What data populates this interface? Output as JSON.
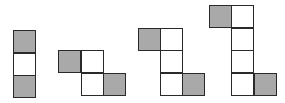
{
  "diagram": {
    "title": "",
    "colors": {
      "shaded": "#a9a9a9",
      "unshaded": "#ffffff",
      "border": "#2a2a2a",
      "background": "#ffffff"
    },
    "cell_size": 23,
    "figures": [
      {
        "index": 1,
        "cells": [
          {
            "x": 13,
            "y": 30,
            "shaded": true
          },
          {
            "x": 13,
            "y": 53,
            "shaded": false
          },
          {
            "x": 13,
            "y": 75,
            "shaded": true
          }
        ]
      },
      {
        "index": 2,
        "cells": [
          {
            "x": 58,
            "y": 50,
            "shaded": true
          },
          {
            "x": 81,
            "y": 50,
            "shaded": false
          },
          {
            "x": 81,
            "y": 73,
            "shaded": false
          },
          {
            "x": 103,
            "y": 73,
            "shaded": true
          }
        ]
      },
      {
        "index": 3,
        "cells": [
          {
            "x": 138,
            "y": 28,
            "shaded": true
          },
          {
            "x": 160,
            "y": 28,
            "shaded": false
          },
          {
            "x": 160,
            "y": 50,
            "shaded": false
          },
          {
            "x": 160,
            "y": 73,
            "shaded": false
          },
          {
            "x": 182,
            "y": 73,
            "shaded": true
          }
        ]
      },
      {
        "index": 4,
        "cells": [
          {
            "x": 209,
            "y": 5,
            "shaded": true
          },
          {
            "x": 231,
            "y": 5,
            "shaded": false
          },
          {
            "x": 231,
            "y": 28,
            "shaded": false
          },
          {
            "x": 231,
            "y": 50,
            "shaded": false
          },
          {
            "x": 231,
            "y": 73,
            "shaded": false
          },
          {
            "x": 254,
            "y": 73,
            "shaded": true
          }
        ]
      }
    ]
  }
}
